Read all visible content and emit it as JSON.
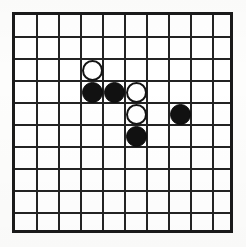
{
  "diagram": {
    "board": {
      "columns": 10,
      "rows": 10,
      "cell_size_px": 22,
      "origin_x_px": 12,
      "origin_y_px": 12,
      "line_color": "#232323",
      "frame_color": "#1a1a1a",
      "background_color": "#ffffff"
    },
    "stone_colors": {
      "black": "#111111",
      "white": "#ffffff",
      "white_outline": "#141414"
    },
    "counts": {
      "black": 4,
      "white": 3,
      "total": 7
    },
    "stones": [
      {
        "id": "white-c3-r2",
        "color": "white",
        "col": 3,
        "row": 2
      },
      {
        "id": "black-c3-r3",
        "color": "black",
        "col": 3,
        "row": 3
      },
      {
        "id": "black-c4-r3",
        "color": "black",
        "col": 4,
        "row": 3
      },
      {
        "id": "white-c5-r3",
        "color": "white",
        "col": 5,
        "row": 3
      },
      {
        "id": "white-c5-r4",
        "color": "white",
        "col": 5,
        "row": 4
      },
      {
        "id": "black-c7-r4",
        "color": "black",
        "col": 7,
        "row": 4
      },
      {
        "id": "black-c5-r5",
        "color": "black",
        "col": 5,
        "row": 5
      }
    ]
  }
}
